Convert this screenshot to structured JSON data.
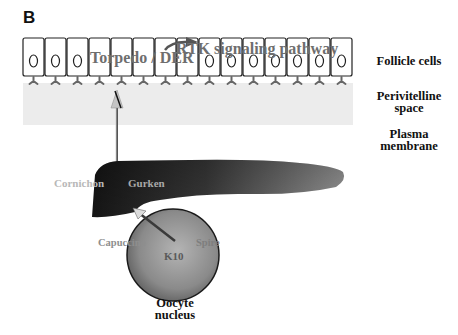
{
  "panel": {
    "letter": "B"
  },
  "labels": {
    "follicle_cells": "Follicle cells",
    "perivitelline_space": "Perivitelline space",
    "perivitelline_line1": "Perivitelline",
    "perivitelline_line2": "space",
    "plasma_membrane_line1": "Plasma",
    "plasma_membrane_line2": "membrane",
    "oocyte_nucleus_line1": "Oocyte",
    "oocyte_nucleus_line2": "nucleus"
  },
  "molecules": {
    "torpedo_der": "Torpedo / DER",
    "rtk_pathway": "RTK signaling pathway",
    "cornichon": "Cornichon",
    "gurken": "Gurken",
    "capuccino": "Capuccino",
    "spire": "Spire",
    "k10": "K10"
  },
  "follicle_cell_count": 15,
  "colors": {
    "perivitelline_band": "#ececec",
    "receptor": "#666666",
    "cell_outline": "#222222",
    "gray_text": "#6e6e6e",
    "light_text": "#b8b8b8",
    "gurken_dark": "#1e1e1e",
    "gurken_light": "#8a8a8a",
    "nucleus_fill": "#8c8c8c"
  }
}
